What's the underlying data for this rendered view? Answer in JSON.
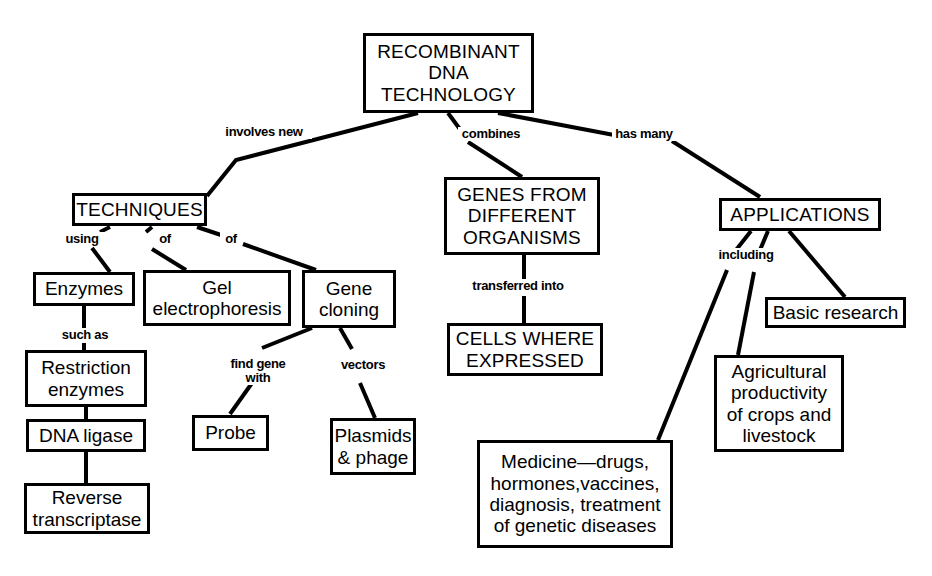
{
  "diagram": {
    "stroke_color": "#000000",
    "background_color": "#ffffff",
    "nodes": [
      {
        "id": "root",
        "label": "RECOMBINANT\nDNA\nTECHNOLOGY",
        "x": 363,
        "y": 33,
        "w": 171,
        "h": 80,
        "style": "caps"
      },
      {
        "id": "techniques",
        "label": "TECHNIQUES",
        "x": 72,
        "y": 193,
        "w": 135,
        "h": 33,
        "style": "caps"
      },
      {
        "id": "genes",
        "label": "GENES FROM\nDIFFERENT\nORGANISMS",
        "x": 444,
        "y": 177,
        "w": 156,
        "h": 78,
        "style": "caps"
      },
      {
        "id": "applications",
        "label": "APPLICATIONS",
        "x": 719,
        "y": 198,
        "w": 162,
        "h": 33,
        "style": "caps"
      },
      {
        "id": "enzymes",
        "label": "Enzymes",
        "x": 33,
        "y": 272,
        "w": 102,
        "h": 34,
        "style": "mixed"
      },
      {
        "id": "gel",
        "label": "Gel\nelectrophoresis",
        "x": 143,
        "y": 270,
        "w": 148,
        "h": 56,
        "style": "mixed"
      },
      {
        "id": "cloning",
        "label": "Gene\ncloning",
        "x": 302,
        "y": 270,
        "w": 94,
        "h": 58,
        "style": "mixed"
      },
      {
        "id": "cells",
        "label": "CELLS WHERE\nEXPRESSED",
        "x": 447,
        "y": 323,
        "w": 156,
        "h": 53,
        "style": "caps"
      },
      {
        "id": "basic",
        "label": "Basic research",
        "x": 765,
        "y": 297,
        "w": 141,
        "h": 31,
        "style": "mixed"
      },
      {
        "id": "restriction",
        "label": "Restriction\nenzymes",
        "x": 25,
        "y": 350,
        "w": 122,
        "h": 57,
        "style": "mixed"
      },
      {
        "id": "probe",
        "label": "Probe",
        "x": 192,
        "y": 415,
        "w": 77,
        "h": 36,
        "style": "mixed"
      },
      {
        "id": "plasmids",
        "label": "Plasmids\n& phage",
        "x": 330,
        "y": 418,
        "w": 86,
        "h": 57,
        "style": "mixed"
      },
      {
        "id": "ligase",
        "label": "DNA ligase",
        "x": 26,
        "y": 419,
        "w": 120,
        "h": 33,
        "style": "mixed"
      },
      {
        "id": "agriculture",
        "label": "Agricultural\nproductivity\nof crops and\nlivestock",
        "x": 714,
        "y": 355,
        "w": 130,
        "h": 97,
        "style": "mixed"
      },
      {
        "id": "reverse",
        "label": "Reverse\ntranscriptase",
        "x": 24,
        "y": 483,
        "w": 126,
        "h": 51,
        "style": "mixed"
      },
      {
        "id": "medicine",
        "label": "Medicine—drugs,\nhormones,vaccines,\ndiagnosis, treatment\nof genetic diseases",
        "x": 477,
        "y": 440,
        "w": 196,
        "h": 108,
        "style": "mixed"
      }
    ],
    "edges": [
      {
        "id": "root-techniques",
        "points": "418,113 236,160 207,196"
      },
      {
        "id": "root-genes",
        "points": "448,113 462,132"
      },
      {
        "id": "root-genes-2",
        "points": "468,142 522,177"
      },
      {
        "id": "root-applications",
        "points": "498,113 614,135"
      },
      {
        "id": "root-applications-2",
        "points": "672,141 760,197"
      },
      {
        "id": "techniques-enzymes",
        "points": "110,227 100,232"
      },
      {
        "id": "techniques-enzymes-2",
        "points": "92,248 110,272"
      },
      {
        "id": "techniques-gel",
        "points": "152,227 146,232"
      },
      {
        "id": "techniques-gel-2",
        "points": "152,249 186,270"
      },
      {
        "id": "techniques-cloning",
        "points": "197,227 221,235"
      },
      {
        "id": "techniques-cloning-2",
        "points": "243,244 316,270"
      },
      {
        "id": "enzymes-restriction",
        "points": "84,306 84,329"
      },
      {
        "id": "enzymes-restriction-2",
        "points": "84,343 84,350"
      },
      {
        "id": "restriction-ligase",
        "points": "86,407 86,419"
      },
      {
        "id": "ligase-reverse",
        "points": "86,452 86,483"
      },
      {
        "id": "cloning-probe",
        "points": "312,328 262,348"
      },
      {
        "id": "cloning-probe-2",
        "points": "252,383 230,414"
      },
      {
        "id": "cloning-plasmids",
        "points": "340,328 352,349"
      },
      {
        "id": "plasmids-link",
        "points": "360,383 375,418"
      },
      {
        "id": "genes-cells",
        "points": "524,255 524,280"
      },
      {
        "id": "genes-cells-2",
        "points": "524,296 524,323"
      },
      {
        "id": "apps-medicine",
        "points": "751,231 736,250"
      },
      {
        "id": "apps-medicine-2",
        "points": "727,270 658,440"
      },
      {
        "id": "apps-agriculture",
        "points": "768,231 760,250"
      },
      {
        "id": "apps-agriculture-2",
        "points": "754,272 738,355"
      },
      {
        "id": "apps-basic",
        "points": "789,231 845,297"
      }
    ],
    "link_labels": [
      {
        "id": "involves-new",
        "text": "involves new",
        "x": 216,
        "y": 125,
        "w": 96
      },
      {
        "id": "combines",
        "text": "combines",
        "x": 458,
        "y": 127,
        "w": 66
      },
      {
        "id": "has-many",
        "text": "has many",
        "x": 612,
        "y": 127,
        "w": 64
      },
      {
        "id": "using",
        "text": "using",
        "x": 60,
        "y": 232,
        "w": 44
      },
      {
        "id": "of-gel",
        "text": "of",
        "x": 154,
        "y": 232,
        "w": 22
      },
      {
        "id": "of-cloning",
        "text": "of",
        "x": 220,
        "y": 232,
        "w": 22
      },
      {
        "id": "such-as",
        "text": "such as",
        "x": 56,
        "y": 328,
        "w": 58
      },
      {
        "id": "transferred-into",
        "text": "transferred into",
        "x": 462,
        "y": 279,
        "w": 112
      },
      {
        "id": "find-gene-with",
        "text": "find gene\nwith",
        "x": 225,
        "y": 357,
        "w": 66
      },
      {
        "id": "vectors",
        "text": "vectors",
        "x": 336,
        "y": 358,
        "w": 54
      },
      {
        "id": "including",
        "text": "including",
        "x": 713,
        "y": 248,
        "w": 66
      }
    ]
  }
}
